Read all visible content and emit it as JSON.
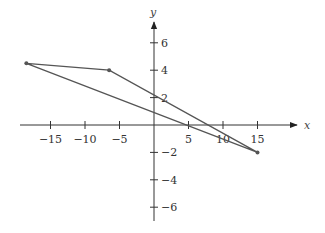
{
  "chart_data": {
    "type": "line",
    "title": "",
    "xlabel": "x",
    "ylabel": "y",
    "xlim": [
      -19,
      21
    ],
    "ylim": [
      -7,
      7.5
    ],
    "grid": false,
    "x_ticks": [
      -15,
      -10,
      -5,
      5,
      10,
      15
    ],
    "x_tick_labels": [
      "−15",
      "−10",
      "−5",
      "5",
      "10",
      "15"
    ],
    "y_ticks": [
      6,
      4,
      2,
      -2,
      -4,
      -6
    ],
    "y_tick_labels": [
      "6",
      "4",
      "2",
      "−2",
      "−4",
      "−6"
    ],
    "series": [
      {
        "name": "triangle",
        "closed": true,
        "points": [
          {
            "x": -18.5,
            "y": 4.5
          },
          {
            "x": -6.5,
            "y": 4
          },
          {
            "x": 15,
            "y": -2
          }
        ]
      }
    ],
    "colors": {
      "line": "#555555",
      "axis": "#333333",
      "point": "#555555"
    }
  }
}
